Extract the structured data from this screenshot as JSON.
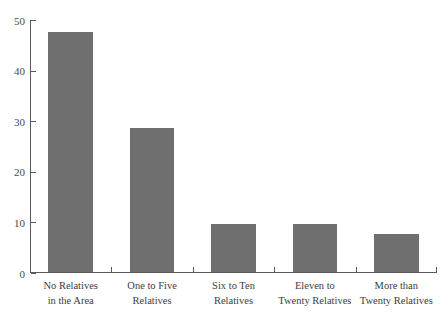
{
  "chart_data": {
    "type": "bar",
    "title": "",
    "subtitle": "",
    "xlabel": "",
    "ylabel": "",
    "categories": [
      "No Relatives in the Area",
      "One to Five Relatives",
      "Six to Ten Relatives",
      "Eleven to Twenty Relatives",
      "More than Twenty Relatives"
    ],
    "category_lines": [
      [
        "No Relatives",
        "in the Area"
      ],
      [
        "One to Five",
        "Relatives"
      ],
      [
        "Six to Ten",
        "Relatives"
      ],
      [
        "Eleven to",
        "Twenty Relatives"
      ],
      [
        "More than",
        "Twenty Relatives"
      ]
    ],
    "values": [
      47.5,
      28.5,
      9.4,
      9.4,
      7.5
    ],
    "ylim": [
      0,
      50
    ],
    "yticks": [
      0,
      10,
      20,
      30,
      40,
      50
    ],
    "ytick_labels": [
      "0",
      "10",
      "20",
      "30",
      "40",
      "50"
    ],
    "grid": false,
    "legend": false,
    "bar_color": "#6f6f6f",
    "axis_color": "#5a5a5a",
    "background": "#ffffff"
  }
}
